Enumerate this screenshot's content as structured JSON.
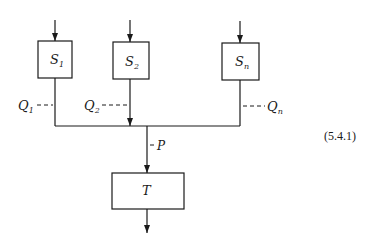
{
  "diagram": {
    "equation_number": "(5.4.1)",
    "sources": [
      {
        "id": "S1",
        "name": "S",
        "sub": "1",
        "flow_label": "Q",
        "flow_sub": "1"
      },
      {
        "id": "S2",
        "name": "S",
        "sub": "2",
        "flow_label": "Q",
        "flow_sub": "2"
      },
      {
        "id": "Sn",
        "name": "S",
        "sub": "n",
        "flow_label": "Q",
        "flow_sub": "n"
      }
    ],
    "combined_flow_label": "P",
    "target": {
      "id": "T",
      "name": "T"
    },
    "colors": {
      "line": "#1a1a1a",
      "background": "#ffffff"
    }
  }
}
